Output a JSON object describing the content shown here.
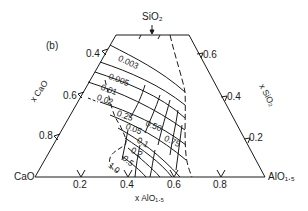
{
  "figure": {
    "panel_label": "(b)",
    "apex_labels": {
      "top": "SiO₂",
      "bottom_left": "CaO",
      "bottom_right": "AlO₁.₅"
    },
    "axis_labels": {
      "left": "x CaO",
      "right": "x SiO₂",
      "bottom": "x AlO₁.₅"
    },
    "left_ticks": [
      "0.4",
      "0.6",
      "0.8"
    ],
    "right_ticks": [
      "0.6",
      "0.4",
      "0.2"
    ],
    "bottom_ticks": [
      "0.2",
      "0.4",
      "0.6",
      "0.8"
    ],
    "contour_labels": [
      "0.003",
      "0.005",
      "0.01",
      "0.02",
      "0.25",
      "0.05",
      "0.50",
      "0.1",
      "0.75",
      "0.2",
      "0.5",
      "1.0"
    ],
    "line_color": "#1a1a1a",
    "background": "#ffffff"
  }
}
